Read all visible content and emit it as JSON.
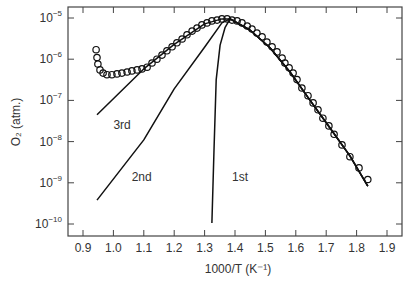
{
  "chart_data": {
    "type": "scatter",
    "title": "",
    "xlabel": "1000/T (K⁻¹)",
    "ylabel": "O₂  (atm.)",
    "xlim": [
      0.86,
      1.95
    ],
    "ylim_log10": [
      -10.3,
      -4.76
    ],
    "yscale": "log",
    "grid": false,
    "legend": "none",
    "x_ticks": [
      0.9,
      1.0,
      1.1,
      1.2,
      1.3,
      1.4,
      1.5,
      1.6,
      1.7,
      1.8,
      1.9
    ],
    "x_tick_labels": [
      "0.9",
      "1.0",
      "1.1",
      "1.2",
      "1.3",
      "1.4",
      "1.5",
      "1.6",
      "1.7",
      "1.8",
      "1.9"
    ],
    "y_ticks_log10": [
      -5,
      -6,
      -7,
      -8,
      -9,
      -10
    ],
    "y_tick_labels": [
      {
        "base": "10",
        "exp": "−5"
      },
      {
        "base": "10",
        "exp": "−6"
      },
      {
        "base": "10",
        "exp": "−7"
      },
      {
        "base": "10",
        "exp": "−8"
      },
      {
        "base": "10",
        "exp": "−9"
      },
      {
        "base": "10",
        "exp": "−10"
      }
    ],
    "series": [
      {
        "name": "measured",
        "kind": "markers",
        "marker": "open-circle",
        "x": [
          0.943,
          0.946,
          0.949,
          0.956,
          0.966,
          0.979,
          0.995,
          1.012,
          1.028,
          1.045,
          1.061,
          1.078,
          1.094,
          1.111,
          1.127,
          1.143,
          1.16,
          1.176,
          1.193,
          1.209,
          1.226,
          1.242,
          1.259,
          1.275,
          1.291,
          1.308,
          1.324,
          1.341,
          1.357,
          1.374,
          1.39,
          1.407,
          1.423,
          1.44,
          1.456,
          1.472,
          1.489,
          1.505,
          1.522,
          1.538,
          1.555,
          1.564,
          1.578,
          1.591,
          1.604,
          1.62,
          1.64,
          1.657,
          1.673,
          1.689,
          1.709,
          1.726,
          1.752,
          1.778,
          1.808,
          1.837
        ],
        "y": [
          1.7e-06,
          1.1e-06,
          7.6e-07,
          5.5e-07,
          4.6e-07,
          4.2e-07,
          4.2e-07,
          4.4e-07,
          4.6e-07,
          4.9e-07,
          5.2e-07,
          5.5e-07,
          5.8e-07,
          6.4e-07,
          8.1e-07,
          1e-06,
          1.26e-06,
          1.6e-06,
          2e-06,
          2.5e-06,
          3.1e-06,
          3.9e-06,
          4.8e-06,
          5.7e-06,
          6.8e-06,
          7.6e-06,
          8.5e-06,
          8.9e-06,
          9.5e-06,
          9.5e-06,
          8.9e-06,
          8.5e-06,
          7.6e-06,
          6.4e-06,
          5.4e-06,
          4.3e-06,
          3.5e-06,
          2.6e-06,
          2e-06,
          1.5e-06,
          1.07e-06,
          8.1e-07,
          6.2e-07,
          4.6e-07,
          3.2e-07,
          2e-07,
          1.3e-07,
          8.7e-08,
          5.9e-08,
          3.7e-08,
          2.4e-08,
          1.5e-08,
          8.3e-09,
          4.3e-09,
          2.3e-09,
          1.2e-09
        ]
      },
      {
        "name": "1st",
        "kind": "line",
        "x": [
          1.324,
          1.331,
          1.338,
          1.351,
          1.367,
          1.384,
          1.449,
          1.515,
          1.581,
          1.647,
          1.713,
          1.778,
          1.837
        ],
        "y": [
          1.05e-10,
          6.3e-09,
          3.2e-07,
          2.2e-06,
          5.8e-06,
          9.5e-06,
          5.1e-06,
          1.9e-06,
          4.9e-07,
          1e-07,
          2.1e-08,
          4.5e-09,
          8.3e-10
        ]
      },
      {
        "name": "2nd",
        "kind": "line",
        "x": [
          0.946,
          1.1,
          1.2,
          1.301,
          1.357,
          1.384,
          1.449,
          1.515,
          1.581,
          1.647,
          1.713,
          1.778,
          1.837
        ],
        "y": [
          3.8e-10,
          1.1e-08,
          1.9e-07,
          2e-06,
          7.6e-06,
          9.5e-06,
          5.1e-06,
          1.9e-06,
          4.9e-07,
          1e-07,
          2.1e-08,
          4.5e-09,
          8.3e-10
        ]
      },
      {
        "name": "3rd",
        "kind": "line",
        "x": [
          0.946,
          1.104,
          1.2,
          1.3,
          1.357,
          1.384,
          1.449,
          1.515,
          1.581,
          1.647,
          1.713,
          1.778,
          1.837
        ],
        "y": [
          4.5e-08,
          6.2e-07,
          2.3e-06,
          7.2e-06,
          9.5e-06,
          9.5e-06,
          5.1e-06,
          1.9e-06,
          4.9e-07,
          1e-07,
          2.1e-08,
          4.5e-09,
          8.3e-10
        ]
      }
    ],
    "annotations": [
      {
        "text": "3rd",
        "x": 1.0,
        "y": 2e-08
      },
      {
        "text": "2nd",
        "x": 1.06,
        "y": 1.1e-09
      },
      {
        "text": "1st",
        "x": 1.39,
        "y": 1.1e-09
      }
    ]
  }
}
